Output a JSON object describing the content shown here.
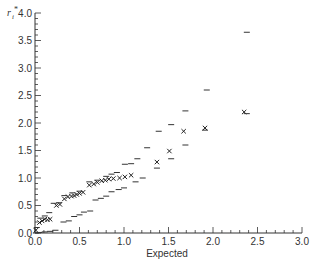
{
  "chart_data": {
    "type": "scatter",
    "title": "",
    "xlabel": "Expected",
    "ylabel": "r_i*",
    "xlim": [
      0,
      3.0
    ],
    "ylim": [
      0,
      4.0
    ],
    "grid": false,
    "legend": null,
    "x_ticks": [
      "0.0",
      "0.5",
      "1.0",
      "1.5",
      "2.0",
      "2.5",
      "3.0"
    ],
    "y_ticks": [
      "0.0",
      "0.5",
      "1.0",
      "1.5",
      "2.0",
      "2.5",
      "3.0",
      "3.5",
      "4.0"
    ],
    "series": [
      {
        "name": "Observed",
        "marker": "x",
        "points": [
          [
            0.01,
            0.05
          ],
          [
            0.05,
            0.19
          ],
          [
            0.08,
            0.22
          ],
          [
            0.11,
            0.25
          ],
          [
            0.14,
            0.24
          ],
          [
            0.17,
            0.25
          ],
          [
            0.24,
            0.5
          ],
          [
            0.28,
            0.52
          ],
          [
            0.33,
            0.62
          ],
          [
            0.37,
            0.66
          ],
          [
            0.41,
            0.67
          ],
          [
            0.44,
            0.68
          ],
          [
            0.47,
            0.7
          ],
          [
            0.5,
            0.72
          ],
          [
            0.54,
            0.74
          ],
          [
            0.61,
            0.87
          ],
          [
            0.66,
            0.89
          ],
          [
            0.7,
            0.92
          ],
          [
            0.75,
            0.95
          ],
          [
            0.79,
            0.96
          ],
          [
            0.83,
            0.98
          ],
          [
            0.88,
            0.99
          ],
          [
            0.95,
            1.0
          ],
          [
            1.01,
            1.02
          ],
          [
            1.08,
            1.05
          ],
          [
            1.37,
            1.29
          ],
          [
            1.51,
            1.49
          ],
          [
            1.67,
            1.85
          ],
          [
            1.91,
            1.91
          ],
          [
            2.35,
            2.2
          ]
        ]
      },
      {
        "name": "Upper envelope",
        "marker": "-",
        "points": [
          [
            0.02,
            0.1
          ],
          [
            0.06,
            0.27
          ],
          [
            0.11,
            0.31
          ],
          [
            0.16,
            0.37
          ],
          [
            0.21,
            0.54
          ],
          [
            0.27,
            0.55
          ],
          [
            0.33,
            0.68
          ],
          [
            0.42,
            0.73
          ],
          [
            0.5,
            0.76
          ],
          [
            0.61,
            0.93
          ],
          [
            0.7,
            0.96
          ],
          [
            0.8,
            1.03
          ],
          [
            0.86,
            1.07
          ],
          [
            0.92,
            1.1
          ],
          [
            1.01,
            1.25
          ],
          [
            1.08,
            1.26
          ],
          [
            1.15,
            1.35
          ],
          [
            1.26,
            1.55
          ],
          [
            1.39,
            1.85
          ],
          [
            1.53,
            1.97
          ],
          [
            1.69,
            2.22
          ],
          [
            1.93,
            2.6
          ],
          [
            2.38,
            3.65
          ]
        ]
      },
      {
        "name": "Lower envelope",
        "marker": "-",
        "points": [
          [
            0.01,
            0.0
          ],
          [
            0.05,
            0.01
          ],
          [
            0.11,
            0.02
          ],
          [
            0.17,
            0.03
          ],
          [
            0.23,
            0.05
          ],
          [
            0.32,
            0.2
          ],
          [
            0.38,
            0.22
          ],
          [
            0.44,
            0.3
          ],
          [
            0.5,
            0.33
          ],
          [
            0.55,
            0.38
          ],
          [
            0.62,
            0.4
          ],
          [
            0.68,
            0.6
          ],
          [
            0.74,
            0.63
          ],
          [
            0.8,
            0.67
          ],
          [
            0.86,
            0.75
          ],
          [
            0.94,
            0.79
          ],
          [
            1.0,
            0.82
          ],
          [
            1.13,
            0.93
          ],
          [
            1.21,
            1.0
          ],
          [
            1.37,
            1.18
          ],
          [
            1.53,
            1.35
          ],
          [
            1.69,
            1.6
          ],
          [
            1.91,
            1.87
          ],
          [
            2.38,
            2.17
          ]
        ]
      }
    ]
  },
  "axes": {
    "xlabel": "Expected",
    "ylabel_main": "r",
    "ylabel_sub": "i",
    "ylabel_sup": "*"
  }
}
